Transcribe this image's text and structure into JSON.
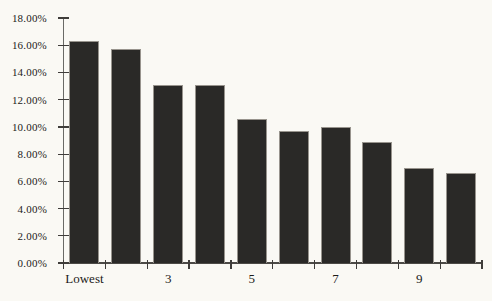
{
  "chart_data": {
    "type": "bar",
    "title": "",
    "xlabel": "",
    "ylabel": "",
    "categories": [
      "Lowest",
      "",
      "3",
      "",
      "5",
      "",
      "7",
      "",
      "9",
      ""
    ],
    "values": [
      16.3,
      15.7,
      13.1,
      13.1,
      10.6,
      9.7,
      10.0,
      8.9,
      7.0,
      6.6
    ],
    "unit": "%",
    "ylim": [
      0,
      18
    ],
    "y_ticks": [
      {
        "value": 0,
        "label": "0.00%"
      },
      {
        "value": 2,
        "label": "2.00%"
      },
      {
        "value": 4,
        "label": "4.00%"
      },
      {
        "value": 6,
        "label": "6.00%"
      },
      {
        "value": 8,
        "label": "8.00%"
      },
      {
        "value": 10,
        "label": "10.00%"
      },
      {
        "value": 12,
        "label": "12.00%"
      },
      {
        "value": 14,
        "label": "14.00%"
      },
      {
        "value": 16,
        "label": "16.00%"
      },
      {
        "value": 18,
        "label": "18.00%"
      }
    ],
    "grid": "off",
    "legend": "none",
    "colors": {
      "bar_fill": "#2a2927",
      "bar_border": "#98948d",
      "axis": "#4c4a46",
      "text": "#1d1b19",
      "background": "#faf9f4"
    }
  }
}
